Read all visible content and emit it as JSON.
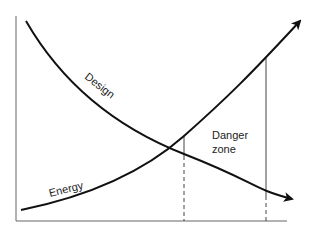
{
  "diagram": {
    "type": "crossing-curves",
    "curves": [
      {
        "name": "Design",
        "trend": "decreasing",
        "arrow": "end"
      },
      {
        "name": "Energy",
        "trend": "increasing",
        "arrow": "end"
      }
    ],
    "labels": {
      "design": "Design",
      "energy": "Energy",
      "danger_line1": "Danger",
      "danger_line2": "zone"
    },
    "axes": {
      "x_label": "",
      "y_label": ""
    },
    "markers": [
      {
        "type": "vertical-line",
        "style": "solid-then-dashed",
        "position": "crossover"
      },
      {
        "type": "vertical-line",
        "style": "solid-then-dashed",
        "position": "right-bound"
      }
    ],
    "colors": {
      "line": "#111111",
      "axis": "#555555",
      "guide": "#444444"
    }
  }
}
